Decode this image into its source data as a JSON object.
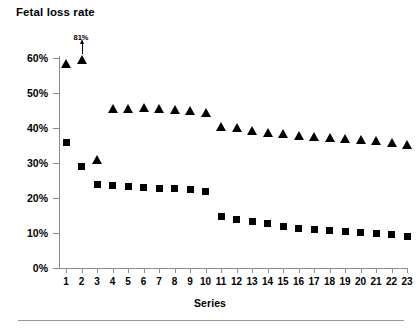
{
  "chart_data": {
    "type": "scatter",
    "title": "Fetal loss rate",
    "xlabel": "Series",
    "ylabel": "Fetal loss rate",
    "ylim": [
      0,
      60
    ],
    "yticks": [
      0,
      10,
      20,
      30,
      40,
      50,
      60
    ],
    "ytick_labels": [
      "0%",
      "10%",
      "20%",
      "30%",
      "40%",
      "50%",
      "60%"
    ],
    "grid": false,
    "legend": "none",
    "categories": [
      1,
      2,
      3,
      4,
      5,
      6,
      7,
      8,
      9,
      10,
      11,
      12,
      13,
      14,
      15,
      16,
      17,
      18,
      19,
      20,
      21,
      22,
      23
    ],
    "xtick_labels": [
      "1",
      "2",
      "3",
      "4",
      "5",
      "6",
      "7",
      "8",
      "9",
      "10",
      "11",
      "12",
      "13",
      "14",
      "15",
      "16",
      "17",
      "18",
      "19",
      "20",
      "21",
      "22",
      "23"
    ],
    "series": [
      {
        "name": "triangles",
        "marker": "triangle",
        "color": "#000000",
        "values": [
          58.5,
          59.5,
          31.0,
          45.5,
          45.7,
          46.0,
          45.7,
          45.3,
          45.0,
          44.5,
          40.5,
          40.2,
          39.3,
          38.7,
          38.3,
          38.0,
          37.6,
          37.3,
          37.0,
          36.7,
          36.4,
          36.0,
          35.3
        ]
      },
      {
        "name": "squares",
        "marker": "square",
        "color": "#000000",
        "values": [
          36.0,
          29.0,
          24.0,
          23.7,
          23.2,
          23.0,
          22.8,
          22.6,
          22.4,
          22.0,
          14.8,
          13.8,
          13.2,
          12.7,
          12.0,
          11.4,
          11.0,
          10.7,
          10.4,
          10.2,
          10.0,
          9.7,
          9.0
        ]
      }
    ],
    "annotations": [
      {
        "text": "81%",
        "series": "triangles",
        "category": 2,
        "description": "off-scale value marked with upward arrow"
      }
    ]
  }
}
